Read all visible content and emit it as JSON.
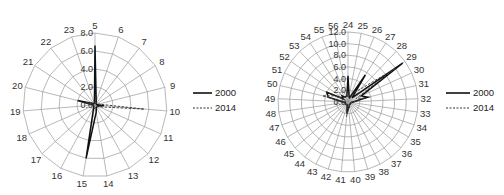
{
  "chart_data": [
    {
      "type": "radar",
      "title": "",
      "categories": [
        "5",
        "6",
        "7",
        "8",
        "9",
        "10",
        "11",
        "12",
        "13",
        "14",
        "15",
        "16",
        "17",
        "18",
        "19",
        "20",
        "21",
        "22",
        "23"
      ],
      "radial_ticks": [
        "0.0",
        "2.0",
        "4.0",
        "6.0",
        "8.0"
      ],
      "rlim": [
        0,
        8
      ],
      "grid": true,
      "legend_position": "right",
      "series": [
        {
          "name": "2000",
          "style": "solid",
          "values": [
            6.6,
            0.4,
            0.2,
            0.2,
            0.2,
            1.0,
            0.3,
            0.3,
            0.3,
            0.8,
            6.0,
            0.3,
            0.2,
            0.2,
            0.2,
            2.0,
            0.3,
            0.2,
            0.2
          ]
        },
        {
          "name": "2014",
          "style": "dashed",
          "values": [
            0.3,
            0.3,
            0.2,
            0.3,
            0.4,
            5.5,
            0.5,
            0.3,
            0.2,
            0.3,
            0.4,
            0.2,
            0.2,
            0.2,
            0.3,
            1.0,
            0.2,
            0.2,
            0.2
          ]
        }
      ]
    },
    {
      "type": "radar",
      "title": "",
      "categories": [
        "24",
        "25",
        "26",
        "27",
        "28",
        "29",
        "30",
        "31",
        "32",
        "33",
        "34",
        "35",
        "36",
        "37",
        "38",
        "39",
        "40",
        "41",
        "42",
        "43",
        "44",
        "45",
        "46",
        "47",
        "48",
        "49",
        "50",
        "51",
        "52",
        "53",
        "54",
        "55",
        "56"
      ],
      "radial_ticks": [
        "0.0",
        "2.0",
        "4.0",
        "6.0",
        "8.0",
        "10.0",
        "12.0"
      ],
      "rlim": [
        0,
        12
      ],
      "grid": true,
      "legend_position": "right",
      "series": [
        {
          "name": "2000",
          "style": "solid",
          "values": [
            4.5,
            1.0,
            0.8,
            5.5,
            1.0,
            11.5,
            2.5,
            3.5,
            1.0,
            0.6,
            0.5,
            0.5,
            0.5,
            0.5,
            0.5,
            0.8,
            1.0,
            2.0,
            0.5,
            0.5,
            0.5,
            0.5,
            0.5,
            0.5,
            0.5,
            1.0,
            3.5,
            4.0,
            1.0,
            1.5,
            1.0,
            1.0,
            1.0
          ]
        },
        {
          "name": "2014",
          "style": "dashed",
          "values": [
            1.0,
            0.8,
            0.5,
            2.0,
            3.0,
            10.0,
            1.5,
            3.0,
            1.0,
            0.5,
            0.5,
            0.5,
            0.5,
            0.5,
            0.5,
            0.8,
            1.0,
            2.5,
            0.5,
            0.5,
            0.5,
            0.5,
            0.5,
            0.5,
            0.5,
            1.0,
            4.5,
            2.5,
            1.0,
            1.0,
            1.0,
            1.0,
            1.0
          ]
        }
      ]
    }
  ],
  "legend": {
    "chart1": {
      "solid_label": "2000",
      "dashed_label": "2014"
    },
    "chart2": {
      "solid_label": "2000",
      "dashed_label": "2014"
    }
  }
}
